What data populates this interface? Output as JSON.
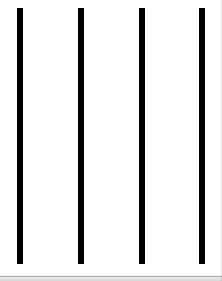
{
  "page": {
    "width": 222,
    "height": 281,
    "background_color": "#ffffff",
    "edge_shading_color": "#000000"
  },
  "chart_data": {
    "type": "bar",
    "title": "",
    "subtitle": "",
    "xlabel": "",
    "ylabel": "",
    "orientation": "vertical",
    "grid": false,
    "legend": null,
    "axis_visible": false,
    "tick_labels_x": [],
    "tick_labels_y": [],
    "categories": [
      "1",
      "2",
      "3",
      "4"
    ],
    "values": [
      256,
      256,
      256,
      256
    ],
    "ylim": [
      0,
      256
    ],
    "bar_color": "#000000",
    "bar_width_px": 6,
    "bar_top_px": 8,
    "bar_height_px": 256,
    "bars": [
      {
        "label": "1",
        "x_px": 17,
        "y_px": 8,
        "width_px": 6,
        "height_px": 256,
        "color": "#000000"
      },
      {
        "label": "2",
        "x_px": 78,
        "y_px": 8,
        "width_px": 6,
        "height_px": 256,
        "color": "#000000"
      },
      {
        "label": "3",
        "x_px": 139,
        "y_px": 8,
        "width_px": 6,
        "height_px": 256,
        "color": "#000000"
      },
      {
        "label": "4",
        "x_px": 199,
        "y_px": 8,
        "width_px": 6,
        "height_px": 256,
        "color": "#000000"
      }
    ]
  }
}
